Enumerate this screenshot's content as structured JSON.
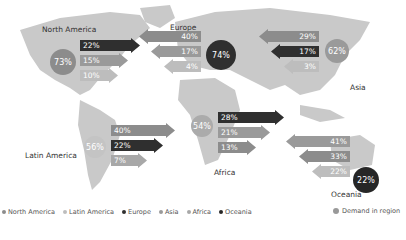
{
  "regions": [
    {
      "key": "north_america",
      "name": "North America",
      "demand": "73%",
      "color": "#8c8c8c",
      "flows": [
        {
          "value": "22%",
          "to": "europe"
        },
        {
          "value": "15%",
          "to": "asia"
        },
        {
          "value": "10%",
          "to": "latin_america"
        }
      ]
    },
    {
      "key": "europe",
      "name": "Europe",
      "demand": "74%",
      "color": "#2f2f2f",
      "flows": [
        {
          "value": "40%",
          "to": "north_america"
        },
        {
          "value": "17%",
          "to": "latin_america"
        },
        {
          "value": "4%",
          "to": "africa"
        }
      ]
    },
    {
      "key": "asia",
      "name": "Asia",
      "demand": "62%",
      "color": "#9a9a9a",
      "flows": [
        {
          "value": "29%",
          "to": "north_america"
        },
        {
          "value": "17%",
          "to": "europe"
        },
        {
          "value": "3%",
          "to": "latin_america"
        }
      ]
    },
    {
      "key": "latin_america",
      "name": "Latin America",
      "demand": "56%",
      "color": "#bdbdbd",
      "flows": [
        {
          "value": "40%",
          "to": "north_america"
        },
        {
          "value": "22%",
          "to": "europe"
        },
        {
          "value": "7%",
          "to": "africa"
        }
      ]
    },
    {
      "key": "africa",
      "name": "Africa",
      "demand": "54%",
      "color": "#a8a8a8",
      "flows": [
        {
          "value": "28%",
          "to": "europe"
        },
        {
          "value": "21%",
          "to": "asia"
        },
        {
          "value": "13%",
          "to": "north_america"
        }
      ]
    },
    {
      "key": "oceania",
      "name": "Oceania",
      "demand": "22%",
      "color": "#262626",
      "flows": [
        {
          "value": "41%",
          "to": "asia"
        },
        {
          "value": "33%",
          "to": "north_america"
        },
        {
          "value": "22%",
          "to": "europe"
        }
      ]
    }
  ],
  "legend": {
    "items": [
      {
        "label": "North America",
        "color": "#8c8c8c"
      },
      {
        "label": "Latin America",
        "color": "#bdbdbd"
      },
      {
        "label": "Europe",
        "color": "#2f2f2f"
      },
      {
        "label": "Asia",
        "color": "#9a9a9a"
      },
      {
        "label": "Africa",
        "color": "#a8a8a8"
      },
      {
        "label": "Oceania",
        "color": "#262626"
      }
    ],
    "demand_label": "Demand in region"
  }
}
